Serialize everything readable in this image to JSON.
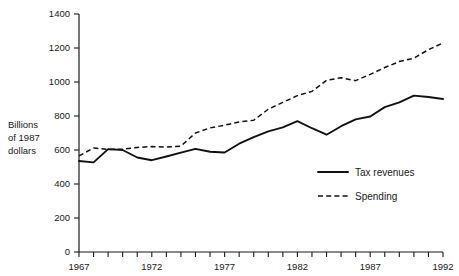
{
  "chart_data": {
    "type": "line",
    "title": "",
    "subtitle": "",
    "xlabel": "",
    "ylabel": "Billions of 1987 dollars",
    "ylabel_lines": [
      "Billions",
      "of 1987",
      "dollars"
    ],
    "xlim": [
      1967,
      1992
    ],
    "ylim": [
      0,
      1400
    ],
    "ytick_step": 200,
    "xtick_step": 1,
    "xtick_label_step": 5,
    "grid": false,
    "legend_position": "inside-right",
    "yticks": [
      0,
      200,
      400,
      600,
      800,
      1000,
      1200,
      1400
    ],
    "ytick_labels": [
      "0",
      "200",
      "400",
      "600",
      "800",
      "1000",
      "1200",
      "1400"
    ],
    "xticks": [
      1967,
      1968,
      1969,
      1970,
      1971,
      1972,
      1973,
      1974,
      1975,
      1976,
      1977,
      1978,
      1979,
      1980,
      1981,
      1982,
      1983,
      1984,
      1985,
      1986,
      1987,
      1988,
      1989,
      1990,
      1991,
      1992
    ],
    "xtick_labels": [
      "1967",
      "1972",
      "1977",
      "1982",
      "1987",
      "1992"
    ],
    "labeled_xticks": [
      1967,
      1972,
      1977,
      1982,
      1987,
      1992
    ],
    "x": [
      1967,
      1968,
      1969,
      1970,
      1971,
      1972,
      1973,
      1974,
      1975,
      1976,
      1977,
      1978,
      1979,
      1980,
      1981,
      1982,
      1983,
      1984,
      1985,
      1986,
      1987,
      1988,
      1989,
      1990,
      1991,
      1992
    ],
    "series": [
      {
        "name": "Tax revenues",
        "style": "solid",
        "color": "#111111",
        "values": [
          535,
          527,
          605,
          600,
          556,
          540,
          562,
          585,
          607,
          590,
          585,
          637,
          676,
          710,
          733,
          770,
          728,
          690,
          740,
          780,
          797,
          852,
          880,
          920,
          912,
          900
        ]
      },
      {
        "name": "Spending",
        "style": "dashed",
        "color": "#111111",
        "values": [
          565,
          612,
          603,
          605,
          615,
          620,
          617,
          623,
          700,
          730,
          746,
          765,
          775,
          840,
          880,
          920,
          945,
          1010,
          1025,
          1008,
          1045,
          1085,
          1120,
          1140,
          1190,
          1230
        ]
      }
    ],
    "legend": [
      {
        "label": "Tax revenues",
        "style": "solid"
      },
      {
        "label": "Spending",
        "style": "dashed"
      }
    ]
  }
}
